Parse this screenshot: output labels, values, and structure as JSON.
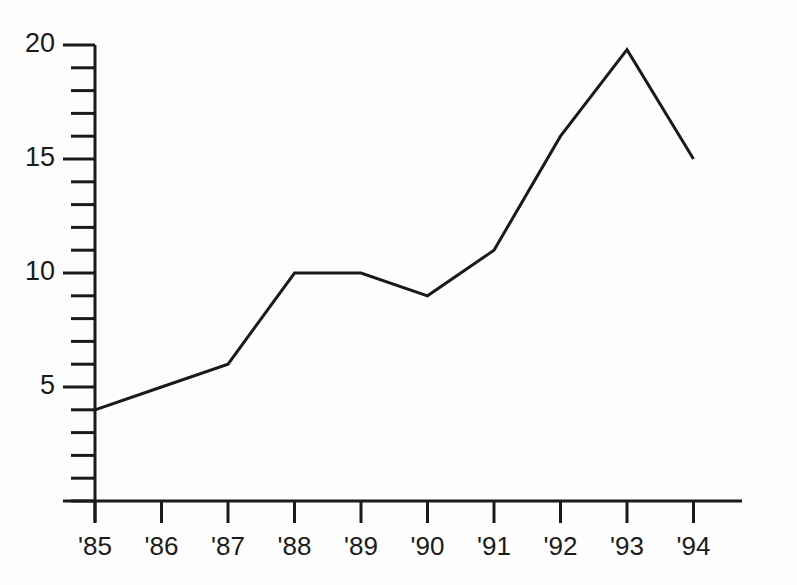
{
  "chart_data": {
    "type": "line",
    "title": "",
    "subtitle": "",
    "xlabel": "",
    "ylabel": "",
    "categories": [
      "'85",
      "'86",
      "'87",
      "'88",
      "'89",
      "'90",
      "'91",
      "'92",
      "'93",
      "'94"
    ],
    "values": [
      4,
      5,
      6,
      10,
      10,
      9,
      11,
      16,
      19.8,
      15
    ],
    "series": [
      {
        "name": "",
        "values": [
          4,
          5,
          6,
          10,
          10,
          9,
          11,
          16,
          19.8,
          15
        ]
      }
    ],
    "ylim": [
      0,
      20
    ],
    "ytick_labels": [
      "5",
      "10",
      "15",
      "20"
    ],
    "ytick_values": [
      5,
      10,
      15,
      20
    ],
    "yminor_step": 1,
    "xtick_labels": [
      "'85",
      "'86",
      "'87",
      "'88",
      "'89",
      "'90",
      "'91",
      "'92",
      "'93",
      "'94"
    ],
    "grid": false,
    "legend": false,
    "legend_position": "none",
    "line_color": "#1a1a1a",
    "background_color": "#fdfdfd",
    "markers": false,
    "annotations": []
  }
}
